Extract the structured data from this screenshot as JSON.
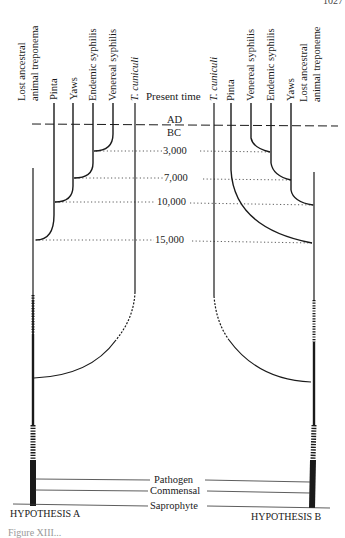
{
  "page": {
    "page_number": "1027",
    "caption_fragment": "Figure XIII..."
  },
  "time_axis": {
    "present_label": "Present time",
    "era_top": "AD",
    "era_bottom": "BC",
    "ticks": [
      "3,000",
      "7,000",
      "10,000",
      "15,000"
    ]
  },
  "hypothesis_a": {
    "title": "HYPOTHESIS A",
    "leaves": [
      {
        "label_line1": "Lost ancestral",
        "label_line2": "animal treponema"
      },
      {
        "label": "Pinta"
      },
      {
        "label": "Yaws"
      },
      {
        "label": "Endemic syphilis"
      },
      {
        "label": "Venereal syphilis"
      },
      {
        "label": "T. cuniculi",
        "italic": true
      }
    ]
  },
  "hypothesis_b": {
    "title": "HYPOTHESIS B",
    "leaves": [
      {
        "label": "T. cuniculi",
        "italic": true
      },
      {
        "label": "Pinta"
      },
      {
        "label": "Venereal syphilis"
      },
      {
        "label": "Endemic syphilis"
      },
      {
        "label": "Yaws"
      },
      {
        "label_line1": "Lost ancestral",
        "label_line2": "animal treponeme"
      }
    ]
  },
  "lifestyle_levels": [
    "Pathogen",
    "Commensal",
    "Saprophyte"
  ],
  "colors": {
    "ink": "#1a1a1a",
    "background": "#ffffff"
  }
}
